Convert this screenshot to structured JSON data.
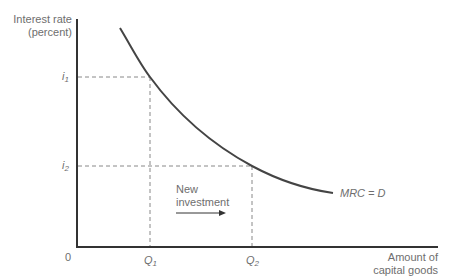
{
  "diagram": {
    "type": "economics-curve",
    "y_axis": {
      "label_line1": "Interest rate",
      "label_line2": "(percent)"
    },
    "x_axis": {
      "label_line1": "Amount of",
      "label_line2": "capital goods"
    },
    "origin_label": "0",
    "curve_label": "MRC = D",
    "y_ticks": [
      {
        "symbol": "i",
        "sub": "1"
      },
      {
        "symbol": "i",
        "sub": "2"
      }
    ],
    "x_ticks": [
      {
        "symbol": "Q",
        "sub": "1"
      },
      {
        "symbol": "Q",
        "sub": "2"
      }
    ],
    "annotation": {
      "line1": "New",
      "line2": "investment",
      "arrow": "right-arrow"
    },
    "colors": {
      "axis": "#333333",
      "curve": "#444444",
      "dashed": "#888888",
      "text": "#6e6e6e"
    }
  }
}
